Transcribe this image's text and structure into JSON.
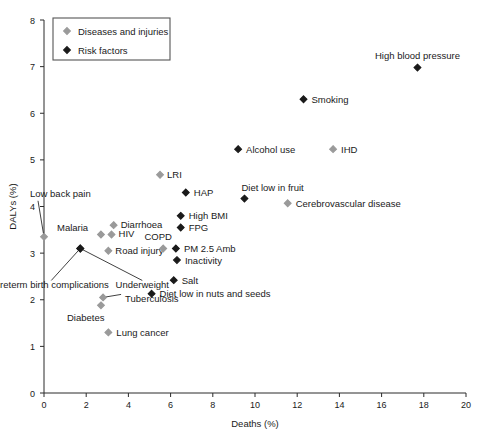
{
  "chart_data": {
    "type": "scatter",
    "title": "",
    "xlabel": "Deaths (%)",
    "ylabel": "DALYs (%)",
    "xlim": [
      0,
      20
    ],
    "ylim": [
      0,
      8
    ],
    "xticks": [
      0,
      2,
      4,
      6,
      8,
      10,
      12,
      14,
      16,
      18,
      20
    ],
    "yticks": [
      0,
      1,
      2,
      3,
      4,
      5,
      6,
      7,
      8
    ],
    "xtick_labels": [
      "0",
      "2",
      "4",
      "6",
      "8",
      "10",
      "12",
      "14",
      "16",
      "18",
      "20"
    ],
    "ytick_labels": [
      "0",
      "1",
      "2",
      "3",
      "4",
      "5",
      "6",
      "7",
      "8"
    ],
    "grid": false,
    "legend_position": "top-left",
    "legend": [
      {
        "label": "Diseases and injuries",
        "marker": "diamond",
        "color": "#9a9a9a"
      },
      {
        "label": "Risk factors",
        "marker": "diamond",
        "color": "#1a1a1a"
      }
    ],
    "series": [
      {
        "name": "Diseases and injuries",
        "color": "#9a9a9a",
        "points": [
          {
            "label": "Low back pain",
            "x": 0.0,
            "y": 3.35,
            "label_dx": -14,
            "label_dy": -40,
            "anchor": "start",
            "leader": true
          },
          {
            "label": "Malaria",
            "x": 2.7,
            "y": 3.4,
            "label_dx": -44,
            "label_dy": -3,
            "anchor": "start",
            "leader": false
          },
          {
            "label": "Diarrhoea",
            "x": 3.3,
            "y": 3.6,
            "label_dx": 7,
            "label_dy": 3,
            "anchor": "start",
            "leader": false
          },
          {
            "label": "HIV",
            "x": 3.2,
            "y": 3.4,
            "label_dx": 7,
            "label_dy": 3,
            "anchor": "start",
            "leader": false
          },
          {
            "label": "Road injury",
            "x": 3.05,
            "y": 3.05,
            "label_dx": 7,
            "label_dy": 3.5,
            "anchor": "start",
            "leader": false
          },
          {
            "label": "COPD",
            "x": 5.65,
            "y": 3.1,
            "label_dx": -5,
            "label_dy": -8,
            "anchor": "middle",
            "leader": false
          },
          {
            "label": "LRI",
            "x": 5.5,
            "y": 4.68,
            "label_dx": 7,
            "label_dy": 3,
            "anchor": "start",
            "leader": false
          },
          {
            "label": "Tuberculosis",
            "x": 2.8,
            "y": 2.05,
            "label_dx": 22,
            "label_dy": 5,
            "anchor": "start",
            "leader": true
          },
          {
            "label": "Diabetes",
            "x": 2.7,
            "y": 1.88,
            "label_dx": -34,
            "label_dy": 16,
            "anchor": "start",
            "leader": false
          },
          {
            "label": "Lung cancer",
            "x": 3.05,
            "y": 1.3,
            "label_dx": 8,
            "label_dy": 3.5,
            "anchor": "start",
            "leader": false
          },
          {
            "label": "IHD",
            "x": 13.7,
            "y": 5.23,
            "label_dx": 8,
            "label_dy": 3.5,
            "anchor": "start",
            "leader": false
          },
          {
            "label": "Cerebrovascular disease",
            "x": 11.55,
            "y": 4.07,
            "label_dx": 8,
            "label_dy": 3.5,
            "anchor": "start",
            "leader": false
          }
        ]
      },
      {
        "name": "Risk factors",
        "color": "#1a1a1a",
        "points": [
          {
            "label": "Preterm birth complications",
            "x": 1.72,
            "y": 3.1,
            "label_dx": -29,
            "label_dy": 40,
            "anchor": "middle",
            "leader": true
          },
          {
            "label": "Underweight",
            "x": 1.72,
            "y": 3.1,
            "label_dx": 62,
            "label_dy": 40,
            "anchor": "middle",
            "leader": true
          },
          {
            "label": "Diet low in nuts and seeds",
            "x": 5.1,
            "y": 2.13,
            "label_dx": 8,
            "label_dy": 3.5,
            "anchor": "start",
            "leader": false
          },
          {
            "label": "Salt",
            "x": 6.15,
            "y": 2.42,
            "label_dx": 8,
            "label_dy": 3.5,
            "anchor": "start",
            "leader": false
          },
          {
            "label": "Inactivity",
            "x": 6.3,
            "y": 2.85,
            "label_dx": 8,
            "label_dy": 3.5,
            "anchor": "start",
            "leader": false
          },
          {
            "label": "PM 2.5 Amb",
            "x": 6.25,
            "y": 3.1,
            "label_dx": 8,
            "label_dy": 3.5,
            "anchor": "start",
            "leader": false
          },
          {
            "label": "FPG",
            "x": 6.48,
            "y": 3.55,
            "label_dx": 8,
            "label_dy": 3.5,
            "anchor": "start",
            "leader": false
          },
          {
            "label": "High BMI",
            "x": 6.48,
            "y": 3.8,
            "label_dx": 8,
            "label_dy": 3.5,
            "anchor": "start",
            "leader": false
          },
          {
            "label": "HAP",
            "x": 6.72,
            "y": 4.3,
            "label_dx": 8,
            "label_dy": 3.5,
            "anchor": "start",
            "leader": false
          },
          {
            "label": "Diet low in fruit",
            "x": 9.5,
            "y": 4.17,
            "label_dx": -3,
            "label_dy": -8,
            "anchor": "start",
            "leader": false
          },
          {
            "label": "Alcohol use",
            "x": 9.2,
            "y": 5.23,
            "label_dx": 8,
            "label_dy": 3.5,
            "anchor": "start",
            "leader": false
          },
          {
            "label": "Smoking",
            "x": 12.3,
            "y": 6.3,
            "label_dx": 8,
            "label_dy": 3.5,
            "anchor": "start",
            "leader": false
          },
          {
            "label": "High blood pressure",
            "x": 17.7,
            "y": 6.98,
            "label_dx": 0,
            "label_dy": -9,
            "anchor": "middle",
            "leader": false
          }
        ]
      }
    ]
  }
}
